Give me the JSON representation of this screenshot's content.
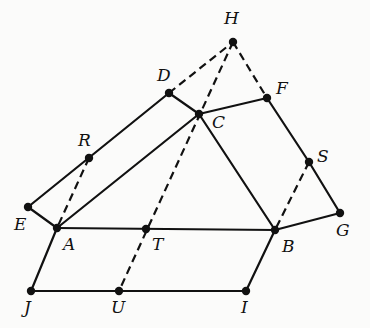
{
  "diagram": {
    "points": [
      {
        "name": "H",
        "x": 233,
        "y": 42,
        "lx": 224,
        "ly": 24
      },
      {
        "name": "D",
        "x": 169,
        "y": 93,
        "lx": 157,
        "ly": 81
      },
      {
        "name": "C",
        "x": 199,
        "y": 114,
        "lx": 212,
        "ly": 128
      },
      {
        "name": "F",
        "x": 267,
        "y": 98,
        "lx": 276,
        "ly": 94
      },
      {
        "name": "R",
        "x": 89,
        "y": 158,
        "lx": 78,
        "ly": 146
      },
      {
        "name": "S",
        "x": 309,
        "y": 162,
        "lx": 317,
        "ly": 162
      },
      {
        "name": "E",
        "x": 28,
        "y": 207,
        "lx": 14,
        "ly": 230
      },
      {
        "name": "A",
        "x": 57,
        "y": 228,
        "lx": 63,
        "ly": 250
      },
      {
        "name": "T",
        "x": 146,
        "y": 229,
        "lx": 152,
        "ly": 250
      },
      {
        "name": "B",
        "x": 275,
        "y": 230,
        "lx": 282,
        "ly": 252
      },
      {
        "name": "G",
        "x": 340,
        "y": 213,
        "lx": 336,
        "ly": 236
      },
      {
        "name": "J",
        "x": 31,
        "y": 291,
        "lx": 24,
        "ly": 313
      },
      {
        "name": "U",
        "x": 119,
        "y": 291,
        "lx": 111,
        "ly": 313
      },
      {
        "name": "I",
        "x": 246,
        "y": 291,
        "lx": 241,
        "ly": 313
      }
    ],
    "solid_segments": [
      [
        "E",
        "D"
      ],
      [
        "D",
        "C"
      ],
      [
        "C",
        "F"
      ],
      [
        "F",
        "S"
      ],
      [
        "S",
        "G"
      ],
      [
        "G",
        "B"
      ],
      [
        "E",
        "A"
      ],
      [
        "A",
        "C"
      ],
      [
        "C",
        "B"
      ],
      [
        "A",
        "B"
      ],
      [
        "A",
        "J"
      ],
      [
        "J",
        "I"
      ],
      [
        "I",
        "B"
      ]
    ],
    "dashed_segments": [
      [
        "D",
        "H"
      ],
      [
        "H",
        "F"
      ],
      [
        "H",
        "U"
      ],
      [
        "R",
        "A"
      ],
      [
        "S",
        "B"
      ]
    ]
  }
}
